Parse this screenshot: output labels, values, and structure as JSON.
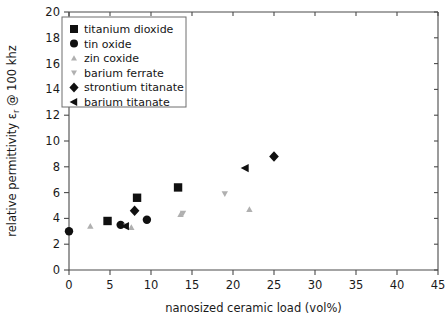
{
  "chart_data": {
    "type": "scatter",
    "title": "",
    "xlabel": "nanosized ceramic load (vol%)",
    "ylabel": "relative permittivity εr @ 100 khz",
    "ylabel_main": "relative permittivity ε",
    "ylabel_sub": "r",
    "ylabel_tail": " @ 100 khz",
    "xlim": [
      0,
      45
    ],
    "ylim": [
      0,
      20
    ],
    "xticks": [
      0,
      5,
      10,
      15,
      20,
      25,
      30,
      35,
      40,
      45
    ],
    "yticks": [
      0,
      2,
      4,
      6,
      8,
      10,
      12,
      14,
      16,
      18,
      20
    ],
    "xtick_labels": [
      "0",
      "5",
      "10",
      "15",
      "20",
      "25",
      "30",
      "35",
      "40",
      "45"
    ],
    "ytick_labels": [
      "0",
      "2",
      "4",
      "6",
      "8",
      "10",
      "12",
      "14",
      "16",
      "18",
      "20"
    ],
    "grid": false,
    "legend_position": "upper-left",
    "series": [
      {
        "name": "titanium dioxide",
        "marker": "square",
        "color": "#101010",
        "points": [
          {
            "x": 4.7,
            "y": 3.8
          },
          {
            "x": 8.3,
            "y": 5.6
          },
          {
            "x": 13.3,
            "y": 6.4
          }
        ]
      },
      {
        "name": "tin oxide",
        "marker": "circle",
        "color": "#101010",
        "points": [
          {
            "x": 0.0,
            "y": 3.0
          },
          {
            "x": 6.3,
            "y": 3.5
          },
          {
            "x": 9.5,
            "y": 3.9
          }
        ]
      },
      {
        "name": "zin coxide",
        "marker": "triangle-up",
        "color": "#b0b0b0",
        "points": [
          {
            "x": 2.6,
            "y": 3.4
          },
          {
            "x": 7.6,
            "y": 3.3
          },
          {
            "x": 13.6,
            "y": 4.3
          },
          {
            "x": 22.0,
            "y": 4.7
          }
        ]
      },
      {
        "name": "barium ferrate",
        "marker": "triangle-down",
        "color": "#b0b0b0",
        "points": [
          {
            "x": 7.0,
            "y": 3.4
          },
          {
            "x": 13.9,
            "y": 4.4
          },
          {
            "x": 19.0,
            "y": 5.9
          }
        ]
      },
      {
        "name": "strontium titanate",
        "marker": "diamond",
        "color": "#101010",
        "points": [
          {
            "x": 8.0,
            "y": 4.6
          },
          {
            "x": 25.0,
            "y": 8.8
          }
        ]
      },
      {
        "name": "barium titanate",
        "marker": "triangle-left",
        "color": "#101010",
        "points": [
          {
            "x": 6.9,
            "y": 3.4
          },
          {
            "x": 21.5,
            "y": 7.9
          }
        ]
      }
    ]
  },
  "legend": {
    "items": [
      {
        "label": "titanium dioxide",
        "marker": "square",
        "color": "#101010"
      },
      {
        "label": "tin oxide",
        "marker": "circle",
        "color": "#101010"
      },
      {
        "label": "zin coxide",
        "marker": "triangle-up",
        "color": "#b0b0b0"
      },
      {
        "label": "barium ferrate",
        "marker": "triangle-down",
        "color": "#b0b0b0"
      },
      {
        "label": "strontium titanate",
        "marker": "diamond",
        "color": "#101010"
      },
      {
        "label": "barium titanate",
        "marker": "triangle-left",
        "color": "#101010"
      }
    ]
  },
  "colors": {
    "axis": "#4a4a4a",
    "text": "#1a1a1a",
    "dark_marker": "#101010",
    "gray_marker": "#b0b0b0",
    "background": "#ffffff"
  }
}
